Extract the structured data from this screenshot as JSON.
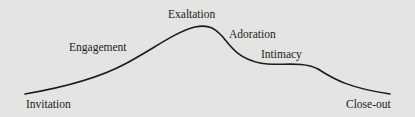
{
  "diagram": {
    "type": "curve",
    "colors": {
      "background": "#e4e4e2",
      "line": "#1c1c1c",
      "text": "#1c1c1c"
    },
    "stages": [
      {
        "label": "Invitation"
      },
      {
        "label": "Engagement"
      },
      {
        "label": "Exaltation"
      },
      {
        "label": "Adoration"
      },
      {
        "label": "Intimacy"
      },
      {
        "label": "Close-out"
      }
    ]
  }
}
